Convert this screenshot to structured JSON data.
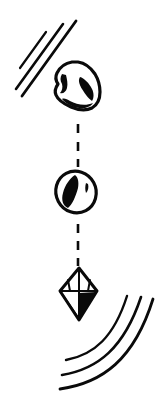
{
  "illustration": {
    "title": "Falling object transformation sequence",
    "background_color": "#ffffff",
    "ink_color": "#0a0a0a",
    "width": 156,
    "height": 404,
    "style": "black-and-white line art",
    "caption": ""
  },
  "objects": [
    {
      "id": "rock",
      "label": "Rock",
      "icon_name": "rock-shape",
      "order": 1,
      "bounds": {
        "x": 53,
        "y": 61,
        "w": 48,
        "h": 50
      },
      "description": "Irregular angular rock with two dark facet patches and a dark lower edge"
    },
    {
      "id": "seed",
      "label": "Seed",
      "icon_name": "oval-seed-shape",
      "order": 2,
      "bounds": {
        "x": 55,
        "y": 171,
        "w": 42,
        "h": 42
      },
      "description": "Tilted oval with a large dark almond core and a small dark sliver"
    },
    {
      "id": "crystal",
      "label": "Crystal",
      "icon_name": "crystal-gem-shape",
      "order": 3,
      "bounds": {
        "x": 59,
        "y": 267,
        "w": 40,
        "h": 54
      },
      "description": "Faceted bipyramidal crystal with dark lower-right facet"
    }
  ],
  "connectors": [
    {
      "id": "connector-rock-seed",
      "label": "Dashed connector between rock and seed",
      "from": "rock",
      "to": "seed",
      "style": "dashed-vertical",
      "x": 78,
      "y_start": 122,
      "y_end": 166,
      "dash_count": 3
    },
    {
      "id": "connector-seed-crystal",
      "label": "Dashed connector between seed and crystal",
      "from": "seed",
      "to": "crystal",
      "style": "dashed-vertical",
      "x": 78,
      "y_start": 222,
      "y_end": 262,
      "dash_count": 3
    }
  ],
  "motion_marks": {
    "top_left": {
      "id": "speed-lines-top-left",
      "label": "Diagonal speed lines",
      "count": 3,
      "orientation": "diagonal descending left",
      "lines": [
        {
          "x1": 75,
          "y1": 22,
          "x2": 22,
          "y2": 95
        },
        {
          "x1": 62,
          "y1": 25,
          "x2": 16,
          "y2": 88
        },
        {
          "x1": 45,
          "y1": 33,
          "x2": 20,
          "y2": 67
        }
      ]
    },
    "bottom_right": {
      "id": "impact-arcs-bottom-right",
      "label": "Curved impact arcs",
      "count": 3,
      "orientation": "concave toward upper-left",
      "arcs": [
        {
          "x1": 61,
          "y1": 388,
          "cx": 128,
          "cy": 368,
          "x2": 152,
          "y2": 300
        },
        {
          "x1": 63,
          "y1": 374,
          "cx": 118,
          "cy": 356,
          "x2": 140,
          "y2": 297
        },
        {
          "x1": 66,
          "y1": 359,
          "cx": 108,
          "cy": 344,
          "x2": 126,
          "y2": 296
        }
      ]
    }
  }
}
